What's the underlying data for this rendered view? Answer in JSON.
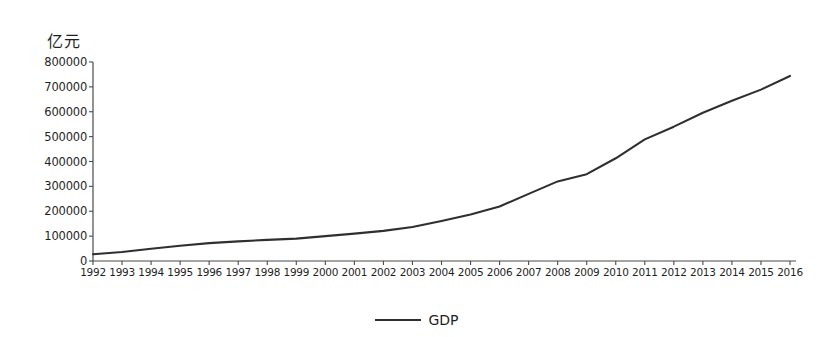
{
  "chart_data": {
    "type": "line",
    "title": "",
    "xlabel": "",
    "ylabel": "亿元",
    "ylim": [
      0,
      800000
    ],
    "yticks": [
      "0",
      "100000",
      "200000",
      "300000",
      "400000",
      "500000",
      "600000",
      "700000",
      "800000"
    ],
    "ytick_values": [
      0,
      100000,
      200000,
      300000,
      400000,
      500000,
      600000,
      700000,
      800000
    ],
    "grid": false,
    "legend_position": "bottom-center",
    "legend": [
      "GDP"
    ],
    "categories": [
      "1992",
      "1993",
      "1994",
      "1995",
      "1996",
      "1997",
      "1998",
      "1999",
      "2000",
      "2001",
      "2002",
      "2003",
      "2004",
      "2005",
      "2006",
      "2007",
      "2008",
      "2009",
      "2010",
      "2011",
      "2012",
      "2013",
      "2014",
      "2015",
      "2016"
    ],
    "series": [
      {
        "name": "GDP",
        "color": "#2f2f2f",
        "values": [
          27000,
          36000,
          49000,
          61000,
          72000,
          79000,
          85000,
          90000,
          100000,
          110000,
          121000,
          137000,
          161000,
          187000,
          219000,
          270000,
          320000,
          349000,
          413000,
          489000,
          540000,
          596000,
          644000,
          689000,
          744000
        ]
      }
    ]
  },
  "axis": {
    "unit_label": "亿元"
  },
  "legend": {
    "gdp_label": "GDP"
  }
}
